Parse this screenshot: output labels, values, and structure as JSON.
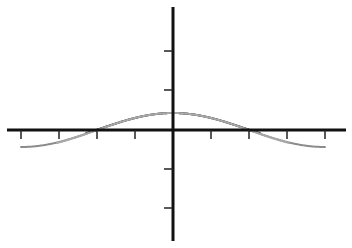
{
  "chart_data": {
    "type": "line",
    "title": "",
    "xlabel": "",
    "ylabel": "",
    "grid": false,
    "legend": null,
    "axes": {
      "origin_px": [
        173,
        130
      ],
      "x_axis_px": [
        7,
        346
      ],
      "y_axis_px": [
        7,
        241
      ],
      "x_ticks_px": [
        21,
        59,
        97,
        135,
        211,
        249,
        287,
        325
      ],
      "y_ticks_px": [
        51,
        90,
        169,
        208
      ],
      "x_tick_unit": "pi/4",
      "x_px_per_unit": 48.4,
      "y_px_per_unit": 17,
      "xlim": [
        -3.4,
        3.4
      ],
      "ylim": [
        -6.6,
        7.2
      ]
    },
    "series": [
      {
        "name": "cos(x)",
        "color": "#8c8c8c",
        "x_range": [
          -3.14,
          3.14
        ],
        "terms": "cos"
      },
      {
        "name": "Taylor degree 4",
        "color": "#3a3a3a",
        "x_range": [
          -1.8,
          1.8
        ],
        "coefficients": [
          1,
          0,
          -0.5,
          0,
          0.0416667
        ],
        "comment": "1 - x^2/2 + x^4/24"
      },
      {
        "name": "Taylor degree 6",
        "color": "#a8a8a8",
        "x_range": [
          -2.4,
          2.4
        ],
        "coefficients": [
          1,
          0,
          -0.5,
          0,
          0.0416667,
          0,
          -0.00138889
        ],
        "comment": "1 - x^2/2 + x^4/24 - x^6/720"
      }
    ]
  }
}
